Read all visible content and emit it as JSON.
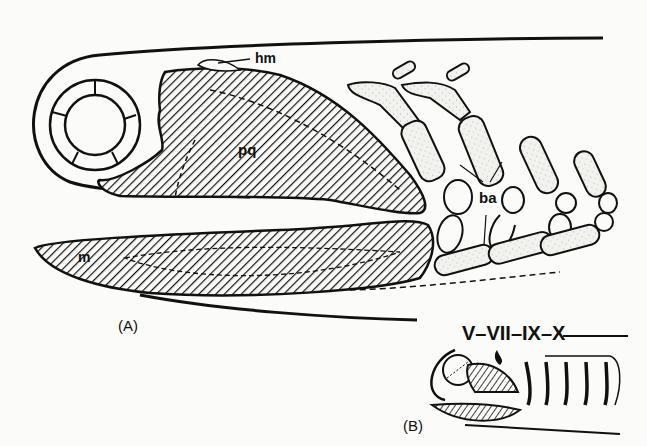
{
  "figure": {
    "panel_a": {
      "caption": "(A)",
      "labels": {
        "hyomandibula": "hm",
        "palatoquadrate": "pq",
        "branchial_arches": "ba",
        "mandible": "m"
      }
    },
    "panel_b": {
      "caption": "(B)",
      "nerve_labels": "V–VII–IX–X"
    }
  }
}
